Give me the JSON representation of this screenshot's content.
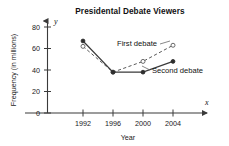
{
  "chart_data": {
    "type": "line",
    "title": "Presidental  Debate Viewers",
    "xlabel": "Year",
    "ylabel": "Frequency (in millions)",
    "x_axis_symbol": "x",
    "y_axis_symbol": "y",
    "categories": [
      "1992",
      "1996",
      "2000",
      "2004"
    ],
    "x": [
      1992,
      1996,
      2000,
      2004
    ],
    "xlim": [
      1990,
      2006
    ],
    "ylim": [
      0,
      88
    ],
    "yticks": [
      "0",
      "20",
      "40",
      "60",
      "80"
    ],
    "ytick_values": [
      0,
      20,
      40,
      60,
      80
    ],
    "grid": false,
    "legend": "inline-labels",
    "series": [
      {
        "name": "First debate",
        "label": "First debate",
        "marker": "open-circle",
        "line": "dashed",
        "values": [
          62,
          38,
          48,
          63
        ],
        "label_x": 2000.0,
        "label_y": 57
      },
      {
        "name": "Second debate",
        "label": "Second debate",
        "marker": "filled-circle",
        "line": "solid",
        "values": [
          67,
          38,
          38,
          48
        ],
        "label_x": 2003.2,
        "label_y": 41
      }
    ]
  },
  "colors": {
    "axis": "#4a4a4a",
    "text": "#111111",
    "series_first": "#5a5a5a",
    "series_second": "#3a3a3a",
    "background": "#ffffff"
  }
}
